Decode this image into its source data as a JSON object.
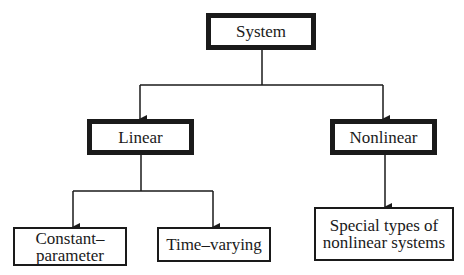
{
  "diagram": {
    "type": "tree",
    "root": {
      "id": "system",
      "label": "System"
    },
    "level1": [
      {
        "id": "linear",
        "label": "Linear"
      },
      {
        "id": "nonlinear",
        "label": "Nonlinear"
      }
    ],
    "level2": [
      {
        "id": "constant",
        "parent": "linear",
        "label_line1": "Constant–",
        "label_line2": "parameter"
      },
      {
        "id": "timevarying",
        "parent": "linear",
        "label": "Time–varying"
      },
      {
        "id": "special",
        "parent": "nonlinear",
        "label_line1": "Special types of",
        "label_line2": "nonlinear systems"
      }
    ],
    "colors": {
      "stroke": "#1a1a1a",
      "background": "#ffffff"
    }
  }
}
